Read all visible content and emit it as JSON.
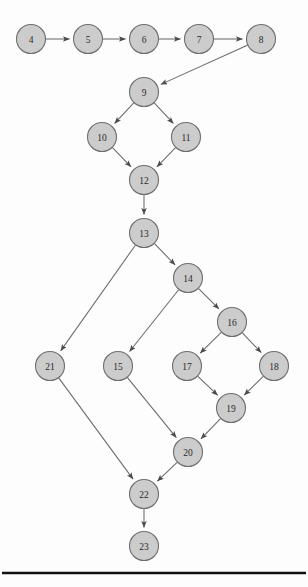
{
  "diagram": {
    "type": "directed-graph",
    "canvas": {
      "width": 308,
      "height": 587
    },
    "style": {
      "node_fill": "#cccccc",
      "node_stroke": "#6e6e6e",
      "edge_stroke": "#6a6a6a",
      "label_color": "#2a2a2a",
      "background": "#fdfdfd",
      "rule_color": "#111111",
      "node_radius": 14.5
    },
    "nodes": [
      {
        "id": "4",
        "label": "4",
        "x": 31,
        "y": 39
      },
      {
        "id": "5",
        "label": "5",
        "x": 88,
        "y": 39
      },
      {
        "id": "6",
        "label": "6",
        "x": 144,
        "y": 39
      },
      {
        "id": "7",
        "label": "7",
        "x": 199,
        "y": 39
      },
      {
        "id": "8",
        "label": "8",
        "x": 261,
        "y": 39
      },
      {
        "id": "9",
        "label": "9",
        "x": 144,
        "y": 92
      },
      {
        "id": "10",
        "label": "10",
        "x": 102,
        "y": 137
      },
      {
        "id": "11",
        "label": "11",
        "x": 186,
        "y": 137
      },
      {
        "id": "12",
        "label": "12",
        "x": 144,
        "y": 180
      },
      {
        "id": "13",
        "label": "13",
        "x": 144,
        "y": 233
      },
      {
        "id": "14",
        "label": "14",
        "x": 188,
        "y": 278
      },
      {
        "id": "16",
        "label": "16",
        "x": 232,
        "y": 322
      },
      {
        "id": "21",
        "label": "21",
        "x": 50,
        "y": 366
      },
      {
        "id": "15",
        "label": "15",
        "x": 118,
        "y": 366
      },
      {
        "id": "17",
        "label": "17",
        "x": 187,
        "y": 366
      },
      {
        "id": "18",
        "label": "18",
        "x": 274,
        "y": 366
      },
      {
        "id": "19",
        "label": "19",
        "x": 231,
        "y": 408
      },
      {
        "id": "20",
        "label": "20",
        "x": 188,
        "y": 452
      },
      {
        "id": "22",
        "label": "22",
        "x": 144,
        "y": 494
      },
      {
        "id": "23",
        "label": "23",
        "x": 144,
        "y": 546
      }
    ],
    "edges": [
      {
        "from": "4",
        "to": "5"
      },
      {
        "from": "5",
        "to": "6"
      },
      {
        "from": "6",
        "to": "7"
      },
      {
        "from": "7",
        "to": "8"
      },
      {
        "from": "8",
        "to": "9"
      },
      {
        "from": "9",
        "to": "10"
      },
      {
        "from": "9",
        "to": "11"
      },
      {
        "from": "10",
        "to": "12"
      },
      {
        "from": "11",
        "to": "12"
      },
      {
        "from": "12",
        "to": "13"
      },
      {
        "from": "13",
        "to": "21"
      },
      {
        "from": "13",
        "to": "14"
      },
      {
        "from": "14",
        "to": "15"
      },
      {
        "from": "14",
        "to": "16"
      },
      {
        "from": "16",
        "to": "17"
      },
      {
        "from": "16",
        "to": "18"
      },
      {
        "from": "17",
        "to": "19"
      },
      {
        "from": "18",
        "to": "19"
      },
      {
        "from": "19",
        "to": "20"
      },
      {
        "from": "15",
        "to": "20"
      },
      {
        "from": "20",
        "to": "22"
      },
      {
        "from": "21",
        "to": "22"
      },
      {
        "from": "22",
        "to": "23"
      }
    ],
    "rule": {
      "y": 573,
      "x1": 2,
      "x2": 306
    }
  }
}
